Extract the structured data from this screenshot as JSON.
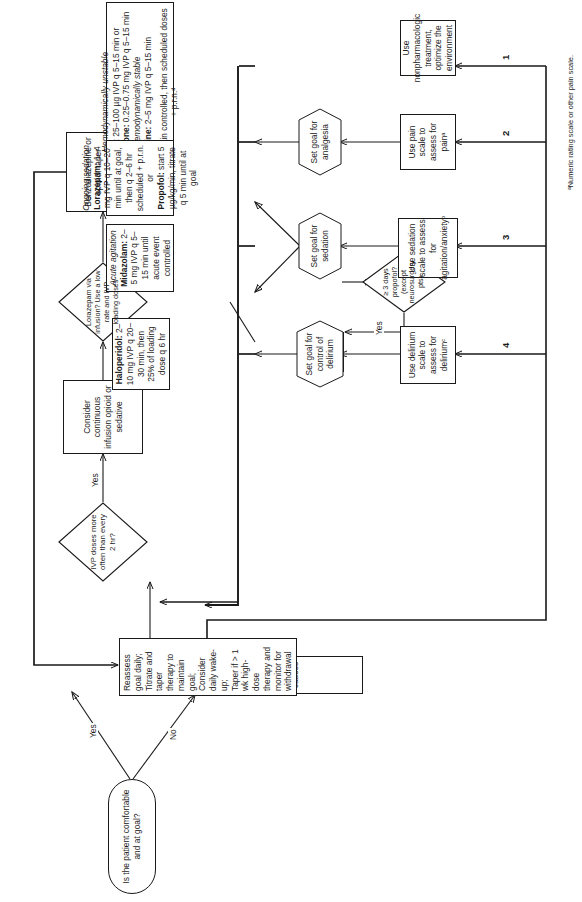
{
  "diagram": {
    "footnote": "ᵃNumeric rating scale or other pain scale.",
    "accent_color": "#1a1a1a",
    "background_color": "#ffffff"
  },
  "nodes": {
    "start": "Is the patient comfortable and at goal?",
    "rule_out": "Rule out and correct reversible causes",
    "reassess": "Reassess goal daily;\nTitrate and taper therapy to maintain goal;\nConsider daily wake-up;\nTaper if > 1 wk high-dose therapy and monitor for withdrawal",
    "ivp_decision": "IVP doses more often than every 2 hr?",
    "ivp_decision_lines": [
      "IVP",
      "doses more",
      "often than",
      "every 2",
      "hr?"
    ],
    "consider_infusion": "Consider continuous infusion opioid or sedative",
    "lorazepam_infusion": "Lorazepam via infusion? Use a low rate and IVP loading doses",
    "lorazepam_infusion_lines": [
      "Lorazepam",
      "via infusion?",
      "Use a low rate and",
      "IVP loading",
      "doses"
    ],
    "benzo_taper": "Benzodiazepine or opioid: taper infusion rate by 10–25% per day",
    "nonpharm": "Use nonpharmacologic treatment, optimize the environment",
    "pain_scale": "Use pain scale to assess for painᵃ",
    "sedation_scale": "Use sedation scale to assess for agitation/anxietyᵇ",
    "delirium_scale": "Use delirium scale to assess for deliriumᶜ",
    "goal_analgesia": "Set goal for analgesia",
    "goal_sedation": "Set goal for sedation",
    "goal_delirium": "Set goal for control of delirium",
    "propofol_decision": "≥ 3 days propofol? (except neurosurgery pts)",
    "propofol_decision_lines": [
      "≥ 3 days",
      "propofol?",
      "(except",
      "neurosurgery",
      "pts)"
    ],
    "convert_lorazepam": "Convert to lorazepam",
    "haloperidol": "Haloperidol: 2–10 mg IVP q 20–30 min, then 25% of loading dose q 6 hr"
  },
  "analgesia_box": {
    "unstable_header": "Hemodynamically unstable",
    "fentanyl_drug": "Fentanyl:",
    "fentanyl_dose": " 25–100 µg IVP q 5–15 min or",
    "hydromorphone_drug": "Hydromorphone:",
    "hydromorphone_dose": " 0.25–0.75 mg IVP q 5–15 min",
    "stable_header": "Hemodynamically stable",
    "morphine_drug": "Morphine:",
    "morphine_dose": " 2–5 mg IVP q 5–15 min",
    "repeat_note": "Repeat until pain controlled, then scheduled doses + p.r.n.ᵈ"
  },
  "acute_agitation_box": {
    "header": "Acute agitation",
    "midazolam_drug": "Midazolam:",
    "midazolam_dose": " 2–5 mg IVP q 5–15 min until acute event controlled"
  },
  "ongoing_sedation_box": {
    "header": "Ongoing sedation",
    "lorazepam_drug": "Lorazepam:",
    "lorazepam_dose": " 1–4 mg IVP q 10–20 min until at goal, then q 2–6 hr scheduled + p.r.n. or",
    "propofol_drug": "Propofol:",
    "propofol_dose": " start 5 µg/kg/min, titrate q 5 min until at goal"
  },
  "haloperidol_box": {
    "drug": "Haloperidol:",
    "dose": " 2–10 mg IVP q 20–30 min, then 25% of loading dose q 6 hr"
  },
  "edge_labels": {
    "yes_start": "Yes",
    "no_start": "No",
    "yes_ivp": "Yes",
    "yes_propofol": "Yes"
  },
  "step_numbers": {
    "one": "1",
    "two": "2",
    "three": "3",
    "four": "4"
  }
}
